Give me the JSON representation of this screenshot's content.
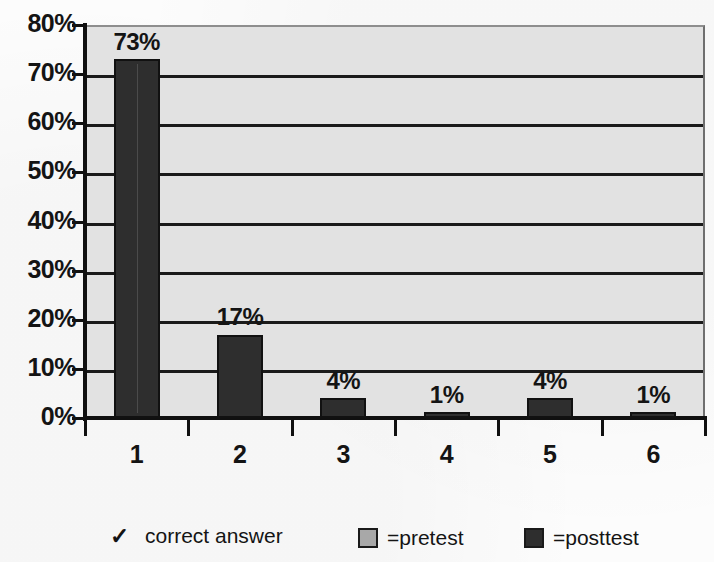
{
  "chart_data": {
    "type": "bar",
    "title": "",
    "xlabel": "",
    "ylabel": "",
    "categories": [
      "1",
      "2",
      "3",
      "4",
      "5",
      "6"
    ],
    "series": [
      {
        "name": "=posttest",
        "color": "#2e2e2e",
        "values": [
          73,
          17,
          4,
          1,
          4,
          1
        ],
        "value_labels": [
          "73%",
          "17%",
          "4%",
          "1%",
          "4%",
          "1%"
        ]
      }
    ],
    "ylim": [
      0,
      80
    ],
    "ytick_values": [
      0,
      10,
      20,
      30,
      40,
      50,
      60,
      70,
      80
    ],
    "ytick_labels": [
      "0%",
      "10%",
      "20%",
      "30%",
      "40%",
      "50%",
      "60%",
      "70%",
      "80%"
    ],
    "grid": true,
    "grid_axis": "y",
    "legend_position": "bottom",
    "plot_background": "#e2e2e2",
    "bar_color": "#2e2e2e",
    "gridline_color": "#1a1a1a"
  },
  "legend": {
    "correct_answer": {
      "icon": "check-icon",
      "glyph": "✓",
      "label": "correct answer"
    },
    "entries": [
      {
        "label": "=pretest",
        "swatch": "#a8a8a8",
        "icon": "pretest-swatch-icon"
      },
      {
        "label": "=posttest",
        "swatch": "#2e2e2e",
        "icon": "posttest-swatch-icon"
      }
    ]
  }
}
